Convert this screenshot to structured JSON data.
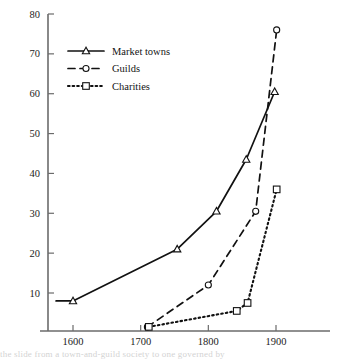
{
  "chart_data": {
    "type": "line",
    "title": "",
    "subtitle": "",
    "xlabel": "",
    "ylabel": "",
    "xlim": [
      1570,
      1930
    ],
    "ylim": [
      0,
      80
    ],
    "grid": false,
    "legend_position": "top-left",
    "x_ticks": [
      1600,
      1700,
      1800,
      1900
    ],
    "x_tick_labels": [
      "1600",
      "1700",
      "1800",
      "1900"
    ],
    "y_ticks": [
      10,
      20,
      30,
      40,
      50,
      60,
      70,
      80
    ],
    "y_tick_labels": [
      "10",
      "20",
      "30",
      "40",
      "50",
      "60",
      "70",
      "80"
    ],
    "series": [
      {
        "name": "Market towns",
        "marker": "triangle",
        "line_style": "solid",
        "color": "#111111",
        "x": [
          1575,
          1600,
          1754,
          1812,
          1856,
          1898
        ],
        "values": [
          8,
          8,
          21,
          30.5,
          43.5,
          60.5
        ],
        "marker_x": [
          1600,
          1754,
          1812,
          1856,
          1898
        ],
        "marker_values": [
          8,
          21,
          30.5,
          43.5,
          60.5
        ]
      },
      {
        "name": "Guilds",
        "marker": "circle",
        "line_style": "dashed",
        "color": "#111111",
        "x": [
          1710,
          1800,
          1870,
          1901
        ],
        "values": [
          1.5,
          12,
          30.5,
          76
        ],
        "marker_x": [
          1710,
          1800,
          1870,
          1901
        ],
        "marker_values": [
          1.5,
          12,
          30.5,
          76
        ]
      },
      {
        "name": "Charities",
        "marker": "square",
        "line_style": "dotted",
        "color": "#111111",
        "x": [
          1712,
          1842,
          1858,
          1901
        ],
        "values": [
          1.5,
          5.5,
          7.5,
          36
        ],
        "marker_x": [
          1712,
          1842,
          1858,
          1901
        ],
        "marker_values": [
          1.5,
          5.5,
          7.5,
          36
        ]
      }
    ],
    "annotations": []
  },
  "legend": {
    "items": [
      {
        "label": "Market towns",
        "icon": "triangle-marker-icon",
        "line_style": "solid"
      },
      {
        "label": "Guilds",
        "icon": "circle-marker-icon",
        "line_style": "dashed"
      },
      {
        "label": "Charities",
        "icon": "square-marker-icon",
        "line_style": "dotted"
      }
    ]
  },
  "page": {
    "bottom_text_fragment": "the slide from a town-and-guild society to one governed by"
  }
}
